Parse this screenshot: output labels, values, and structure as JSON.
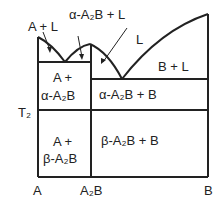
{
  "diagram": {
    "type": "binary phase diagram",
    "regions": {
      "a_plus_l": "A + L",
      "alpha_plus_l": "α-A₂B + L",
      "liquid": "L",
      "b_plus_l": "B + L",
      "a_alpha_1": "A +",
      "a_alpha_2": "α-A₂B",
      "alpha_b": "α-A₂B + B",
      "a_beta_1": "A +",
      "a_beta_2": "β-A₂B",
      "beta_b": "β-A₂B + B"
    },
    "axis": {
      "left": "A",
      "middle": "A₂B",
      "right": "B",
      "temp_label": "T₂"
    }
  }
}
